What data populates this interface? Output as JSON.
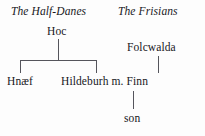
{
  "diagram": {
    "groups": [
      {
        "id": "half-danes",
        "label": "The Half-Danes"
      },
      {
        "id": "frisians",
        "label": "The Frisians"
      }
    ],
    "people": [
      {
        "id": "hoc",
        "label": "Hoc"
      },
      {
        "id": "folcwalda",
        "label": "Folcwalda"
      },
      {
        "id": "hnaef",
        "label": "Hnæf"
      },
      {
        "id": "hildeburh",
        "label": "Hildeburh m. Finn"
      },
      {
        "id": "son",
        "label": "son"
      }
    ],
    "colors": {
      "background": "#fdfdfd",
      "text": "#17171c",
      "line": "#55555c"
    }
  }
}
